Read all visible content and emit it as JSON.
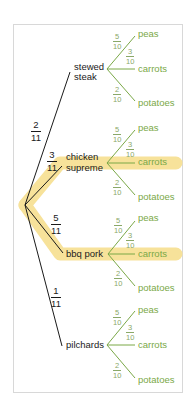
{
  "colors": {
    "highlight": "#f7e29a",
    "branch_main": "#1a1a1a",
    "branch_sub": "#7aa847",
    "leaf_text": "#7aa847"
  },
  "root": {
    "x": 25,
    "y": 205
  },
  "mains": [
    {
      "label_line1": "stewed",
      "label_line2": "steak",
      "prob_num": "2",
      "prob_den": "11",
      "highlighted": false
    },
    {
      "label_line1": "chicken",
      "label_line2": "supreme",
      "prob_num": "3",
      "prob_den": "11",
      "highlighted": true
    },
    {
      "label_line1": "bbq pork",
      "label_line2": "",
      "prob_num": "5",
      "prob_den": "11",
      "highlighted": true
    },
    {
      "label_line1": "pilchards",
      "label_line2": "",
      "prob_num": "1",
      "prob_den": "11",
      "highlighted": false
    }
  ],
  "leaves": [
    {
      "label": "peas",
      "prob_num": "5",
      "prob_den": "10"
    },
    {
      "label": "carrots",
      "prob_num": "3",
      "prob_den": "10"
    },
    {
      "label": "potatoes",
      "prob_num": "2",
      "prob_den": "10"
    }
  ],
  "g0": {
    "n1": "stewed",
    "n2": "steak",
    "pn": "2",
    "pd": "11",
    "l0": "peas",
    "l1": "carrots",
    "l2": "potatoes",
    "p0n": "5",
    "p0d": "10",
    "p1n": "3",
    "p1d": "10",
    "p2n": "2",
    "p2d": "10"
  },
  "g1": {
    "n1": "chicken",
    "n2": "supreme",
    "pn": "3",
    "pd": "11",
    "l0": "peas",
    "l1": "carrots",
    "l2": "potatoes",
    "p0n": "5",
    "p0d": "10",
    "p1n": "3",
    "p1d": "10",
    "p2n": "2",
    "p2d": "10"
  },
  "g2": {
    "n1": "bbq pork",
    "pn": "5",
    "pd": "11",
    "l0": "peas",
    "l1": "carrots",
    "l2": "potatoes",
    "p0n": "5",
    "p0d": "10",
    "p1n": "3",
    "p1d": "10",
    "p2n": "2",
    "p2d": "10"
  },
  "g3": {
    "n1": "pilchards",
    "pn": "1",
    "pd": "11",
    "l0": "peas",
    "l1": "carrots",
    "l2": "potatoes",
    "p0n": "5",
    "p0d": "10",
    "p1n": "3",
    "p1d": "10",
    "p2n": "2",
    "p2d": "10"
  }
}
